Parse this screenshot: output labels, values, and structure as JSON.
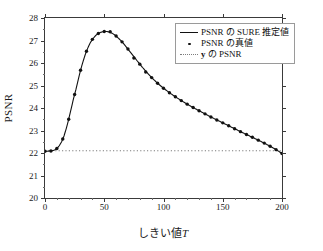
{
  "chart_data": {
    "type": "line",
    "title": "",
    "xlabel": "しきい値 T",
    "xlabel_plain": "しきい値",
    "xlabel_italic": "T",
    "ylabel": "PSNR",
    "xlim": [
      0,
      200
    ],
    "ylim": [
      20,
      28
    ],
    "xticks": [
      0,
      50,
      100,
      150,
      200
    ],
    "xticklabels": [
      "0",
      "50",
      "100",
      "150",
      "200"
    ],
    "yticks": [
      20,
      21,
      22,
      23,
      24,
      25,
      26,
      27,
      28
    ],
    "yticklabels": [
      "20",
      "21",
      "22",
      "23",
      "24",
      "25",
      "26",
      "27",
      "28"
    ],
    "grid": false,
    "legend_position": "upper right",
    "series": [
      {
        "name": "PSNR の SURE 推定値",
        "style": "solid-line",
        "color": "#111111",
        "x": [
          0,
          2,
          4,
          6,
          8,
          10,
          12,
          14,
          16,
          18,
          20,
          22,
          24,
          26,
          28,
          30,
          32,
          34,
          36,
          38,
          40,
          42,
          44,
          46,
          48,
          50,
          52,
          54,
          56,
          58,
          60,
          62,
          64,
          66,
          68,
          70,
          74,
          78,
          82,
          86,
          90,
          95,
          100,
          105,
          110,
          115,
          120,
          125,
          130,
          135,
          140,
          145,
          150,
          155,
          160,
          165,
          170,
          175,
          180,
          185,
          190,
          195,
          200
        ],
        "y": [
          22.08,
          22.08,
          22.09,
          22.1,
          22.13,
          22.2,
          22.32,
          22.5,
          22.75,
          23.1,
          23.5,
          23.95,
          24.4,
          24.8,
          25.25,
          25.68,
          26.05,
          26.38,
          26.65,
          26.88,
          27.05,
          27.18,
          27.28,
          27.34,
          27.38,
          27.4,
          27.4,
          27.38,
          27.34,
          27.28,
          27.2,
          27.1,
          27.0,
          26.88,
          26.75,
          26.62,
          26.35,
          26.08,
          25.82,
          25.58,
          25.35,
          25.1,
          24.88,
          24.68,
          24.5,
          24.33,
          24.17,
          24.02,
          23.88,
          23.74,
          23.6,
          23.47,
          23.34,
          23.21,
          23.08,
          22.95,
          22.82,
          22.7,
          22.57,
          22.44,
          22.3,
          22.15,
          21.98
        ]
      },
      {
        "name": "PSNR の真値",
        "style": "dot-markers",
        "color": "#111111",
        "x": [
          0,
          5,
          10,
          15,
          20,
          25,
          30,
          35,
          40,
          45,
          50,
          55,
          60,
          65,
          70,
          75,
          80,
          85,
          90,
          95,
          100,
          105,
          110,
          115,
          120,
          125,
          130,
          135,
          140,
          145,
          150,
          155,
          160,
          165,
          170,
          175,
          180,
          185,
          190,
          195,
          200
        ],
        "y": [
          22.08,
          22.09,
          22.2,
          22.62,
          23.5,
          24.6,
          25.68,
          26.52,
          27.05,
          27.31,
          27.4,
          27.39,
          27.2,
          26.94,
          26.62,
          26.22,
          25.95,
          25.6,
          25.35,
          25.1,
          24.88,
          24.68,
          24.5,
          24.33,
          24.17,
          24.02,
          23.88,
          23.74,
          23.6,
          23.47,
          23.34,
          23.21,
          23.08,
          22.95,
          22.82,
          22.7,
          22.57,
          22.44,
          22.3,
          22.15,
          21.98
        ]
      },
      {
        "name": "y の PSNR",
        "style": "dotted-horizontal",
        "color": "#7d7d7d",
        "value": 22.1
      }
    ]
  },
  "legend": {
    "items": [
      {
        "label": "PSNR の SURE 推定値",
        "key": "solid-line"
      },
      {
        "label": "PSNR の真値",
        "key": "dot-marker"
      },
      {
        "label_pre": "y",
        "label_post": " の PSNR",
        "key": "dotted-line"
      }
    ]
  }
}
